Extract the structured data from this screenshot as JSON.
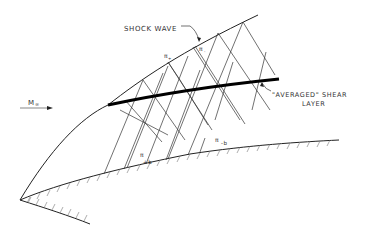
{
  "diagram": {
    "title": "",
    "labels": {
      "shock_wave": "SHOCK WAVE",
      "freestream_mach": "M",
      "freestream_mach_sub": "∞",
      "shear_layer_line1": "\"AVERAGED\" SHEAR",
      "shear_layer_line2": "LAYER",
      "pi_plus": "π",
      "pi_plus_sub": "+",
      "pi_minus": "π",
      "pi_minus_sub": "-",
      "pi_minus_b": "π",
      "pi_minus_b_sub": "-b",
      "pi_plus_b": "π",
      "pi_plus_b_sub": "+b"
    },
    "elements": [
      "shock-wave-curve",
      "averaged-shear-layer",
      "upper-wall-surface",
      "lower-wall-surface",
      "characteristic-lines",
      "freestream-arrow"
    ],
    "colors": {
      "line": "#222222",
      "hatch": "#777777",
      "background": "#ffffff"
    }
  }
}
